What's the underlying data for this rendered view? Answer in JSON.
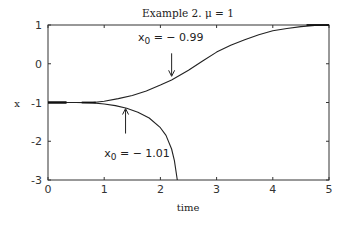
{
  "chart_data": {
    "type": "line",
    "title": "Example 2.     μ = 1",
    "xlabel": "time",
    "ylabel": "x",
    "xlim": [
      0,
      5
    ],
    "ylim": [
      -3,
      1
    ],
    "xticks": [
      0,
      1,
      2,
      3,
      4,
      5
    ],
    "yticks": [
      1,
      0,
      -1,
      -2,
      -3
    ],
    "grid": false,
    "legend": null,
    "series": [
      {
        "name": "x0 = -0.99",
        "x": [
          0,
          0.5,
          0.8,
          1.0,
          1.25,
          1.5,
          1.75,
          2.0,
          2.2,
          2.5,
          2.75,
          3.0,
          3.25,
          3.5,
          3.75,
          4.0,
          4.25,
          4.5,
          4.75,
          5.0
        ],
        "y": [
          -1,
          -1,
          -1,
          -0.97,
          -0.9,
          -0.82,
          -0.7,
          -0.55,
          -0.42,
          -0.17,
          0.07,
          0.3,
          0.48,
          0.62,
          0.75,
          0.85,
          0.91,
          0.96,
          0.99,
          1.0
        ]
      },
      {
        "name": "x0 = -1.01",
        "x": [
          0,
          0.5,
          0.8,
          1.0,
          1.2,
          1.4,
          1.6,
          1.8,
          2.0,
          2.1,
          2.2,
          2.25,
          2.3
        ],
        "y": [
          -1,
          -1,
          -1.01,
          -1.04,
          -1.08,
          -1.15,
          -1.25,
          -1.4,
          -1.65,
          -1.85,
          -2.2,
          -2.5,
          -3.0
        ]
      }
    ],
    "annotations": [
      {
        "text_main": "x",
        "text_sub": "0",
        "text_rest": " = − 0.99",
        "x": 1.6,
        "y": 0.6,
        "arrow_to": [
          2.2,
          -0.35
        ]
      },
      {
        "text_main": "x",
        "text_sub": "0",
        "text_rest": " = − 1.01",
        "x": 1.0,
        "y": -2.4,
        "arrow_to": [
          1.38,
          -1.13
        ]
      }
    ]
  }
}
